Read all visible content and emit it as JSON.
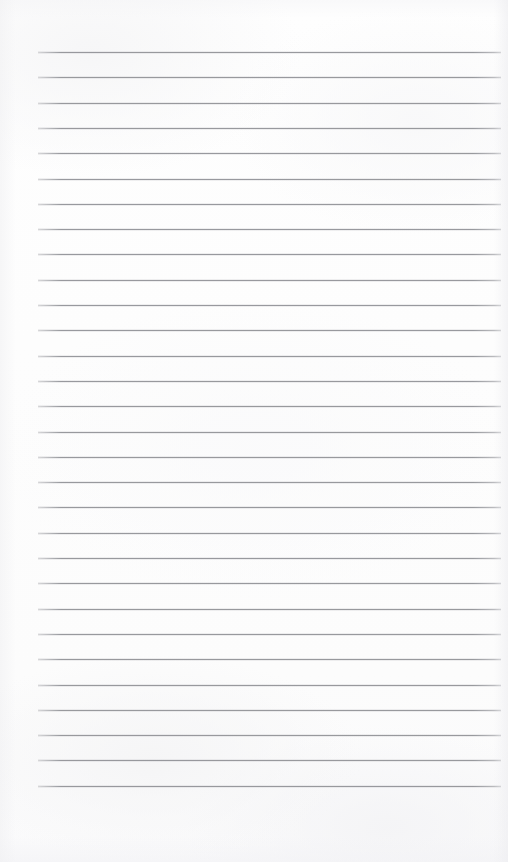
{
  "document": {
    "kind": "scanned-ruled-notebook-page",
    "title": "Blank Lined Paper",
    "body_text": "",
    "is_blank": true,
    "handwriting": [],
    "printed_text": [],
    "page_number": ""
  },
  "paper": {
    "background_color": "#fdfdfd",
    "edge_shadow_color": "#f0f0f2",
    "width_px": 508,
    "height_px": 862
  },
  "ruling": {
    "line_color": "#8f9196",
    "line_thickness_px": 1,
    "line_spacing_px": 25.3,
    "first_line_y_px": 52,
    "left_margin_px": 38,
    "right_margin_px": 501,
    "line_count": 30,
    "has_vertical_margin_rule": false,
    "has_binding_holes": false,
    "lines": [
      {
        "index": 1,
        "y": 52.0,
        "x_start": 38,
        "x_end": 501
      },
      {
        "index": 2,
        "y": 77.3,
        "x_start": 38,
        "x_end": 501
      },
      {
        "index": 3,
        "y": 102.6,
        "x_start": 38,
        "x_end": 501
      },
      {
        "index": 4,
        "y": 127.9,
        "x_start": 38,
        "x_end": 501
      },
      {
        "index": 5,
        "y": 153.2,
        "x_start": 38,
        "x_end": 501
      },
      {
        "index": 6,
        "y": 178.5,
        "x_start": 38,
        "x_end": 501
      },
      {
        "index": 7,
        "y": 203.8,
        "x_start": 38,
        "x_end": 501
      },
      {
        "index": 8,
        "y": 229.1,
        "x_start": 38,
        "x_end": 501
      },
      {
        "index": 9,
        "y": 254.4,
        "x_start": 38,
        "x_end": 501
      },
      {
        "index": 10,
        "y": 279.7,
        "x_start": 38,
        "x_end": 501
      },
      {
        "index": 11,
        "y": 305.0,
        "x_start": 38,
        "x_end": 501
      },
      {
        "index": 12,
        "y": 330.3,
        "x_start": 38,
        "x_end": 501
      },
      {
        "index": 13,
        "y": 355.6,
        "x_start": 38,
        "x_end": 501
      },
      {
        "index": 14,
        "y": 380.9,
        "x_start": 38,
        "x_end": 501
      },
      {
        "index": 15,
        "y": 406.2,
        "x_start": 38,
        "x_end": 501
      },
      {
        "index": 16,
        "y": 431.5,
        "x_start": 38,
        "x_end": 501
      },
      {
        "index": 17,
        "y": 456.8,
        "x_start": 38,
        "x_end": 501
      },
      {
        "index": 18,
        "y": 482.1,
        "x_start": 38,
        "x_end": 501
      },
      {
        "index": 19,
        "y": 507.4,
        "x_start": 38,
        "x_end": 501
      },
      {
        "index": 20,
        "y": 532.7,
        "x_start": 38,
        "x_end": 501
      },
      {
        "index": 21,
        "y": 558.0,
        "x_start": 38,
        "x_end": 501
      },
      {
        "index": 22,
        "y": 583.3,
        "x_start": 38,
        "x_end": 501
      },
      {
        "index": 23,
        "y": 608.6,
        "x_start": 38,
        "x_end": 501
      },
      {
        "index": 24,
        "y": 633.9,
        "x_start": 38,
        "x_end": 501
      },
      {
        "index": 25,
        "y": 659.2,
        "x_start": 38,
        "x_end": 501
      },
      {
        "index": 26,
        "y": 684.5,
        "x_start": 38,
        "x_end": 501
      },
      {
        "index": 27,
        "y": 709.8,
        "x_start": 38,
        "x_end": 501
      },
      {
        "index": 28,
        "y": 735.1,
        "x_start": 38,
        "x_end": 501
      },
      {
        "index": 29,
        "y": 760.4,
        "x_start": 38,
        "x_end": 501
      },
      {
        "index": 30,
        "y": 785.7,
        "x_start": 38,
        "x_end": 501
      }
    ]
  }
}
